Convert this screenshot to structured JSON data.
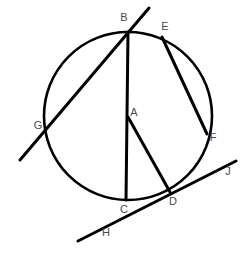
{
  "figure": {
    "type": "geometry-diagram",
    "background_color": "#ffffff",
    "stroke_color": "#000000",
    "label_color": "#4a4a4a",
    "canvas": {
      "width": 245,
      "height": 255
    }
  },
  "circle": {
    "name": "main-circle",
    "center_x": 128,
    "center_y": 116,
    "radius": 84,
    "stroke_width": 2.6
  },
  "points": [
    {
      "id": "A",
      "label": "A",
      "x": 128,
      "y": 117,
      "label_x": 134,
      "label_y": 113,
      "role": "center"
    },
    {
      "id": "B",
      "label": "B",
      "x": 128,
      "y": 32,
      "label_x": 124,
      "label_y": 18,
      "role": "on-circle"
    },
    {
      "id": "C",
      "label": "C",
      "x": 126,
      "y": 200,
      "label_x": 124,
      "label_y": 210,
      "role": "on-circle"
    },
    {
      "id": "D",
      "label": "D",
      "x": 170,
      "y": 192,
      "label_x": 173,
      "label_y": 202,
      "role": "tangent-point"
    },
    {
      "id": "E",
      "label": "E",
      "x": 163,
      "y": 38,
      "label_x": 165,
      "label_y": 27,
      "role": "on-circle"
    },
    {
      "id": "F",
      "label": "F",
      "x": 206,
      "y": 133,
      "label_x": 213,
      "label_y": 138,
      "role": "on-circle"
    },
    {
      "id": "G",
      "label": "G",
      "x": 46,
      "y": 134,
      "label_x": 38,
      "label_y": 126,
      "role": "on-circle"
    },
    {
      "id": "H",
      "label": "H",
      "x": 78,
      "y": 240,
      "label_x": 106,
      "label_y": 233,
      "role": "line-end"
    },
    {
      "id": "J",
      "label": "J",
      "x": 236,
      "y": 162,
      "label_x": 228,
      "label_y": 172,
      "role": "line-end"
    }
  ],
  "segments": [
    {
      "id": "secant-GB",
      "name": "secant-line-through-g-and-b",
      "x1": 20,
      "y1": 160,
      "x2": 149,
      "y2": 8,
      "stroke_width": 3.0
    },
    {
      "id": "chord-BC",
      "name": "chord-b-to-c",
      "x1": 128,
      "y1": 32,
      "x2": 126,
      "y2": 200,
      "stroke_width": 3.0
    },
    {
      "id": "chord-EF",
      "name": "chord-e-to-f",
      "x1": 162,
      "y1": 37,
      "x2": 207,
      "y2": 134,
      "stroke_width": 3.0
    },
    {
      "id": "radius-AD",
      "name": "radius-a-to-d",
      "x1": 128,
      "y1": 117,
      "x2": 170,
      "y2": 192,
      "stroke_width": 3.0
    },
    {
      "id": "tangent-HJ",
      "name": "tangent-line-h-to-j",
      "x1": 78,
      "y1": 241,
      "x2": 236,
      "y2": 161,
      "stroke_width": 3.0
    }
  ]
}
